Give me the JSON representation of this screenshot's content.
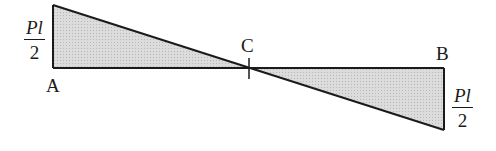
{
  "diagram": {
    "type": "bending-moment-diagram",
    "points": {
      "A": {
        "label": "A"
      },
      "B": {
        "label": "B"
      },
      "C": {
        "label": "C"
      }
    },
    "left_value": {
      "numerator": "Pl",
      "denominator": "2"
    },
    "right_value": {
      "numerator": "Pl",
      "denominator": "2"
    },
    "colors": {
      "fill": "#d4d4d4",
      "stroke": "#1a1a1a"
    }
  }
}
